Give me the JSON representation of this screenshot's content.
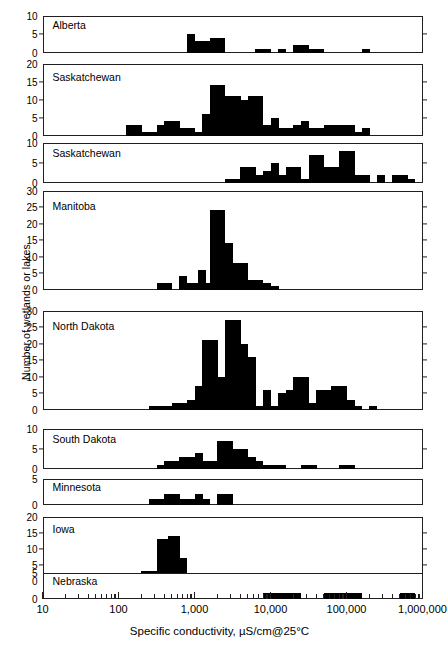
{
  "figure": {
    "ylabel": "Number of wetlands or lakes",
    "xlabel": "Specific conductivity, µS/cm@25°C",
    "x_axis": {
      "scale": "log",
      "min": 10,
      "max": 1000000,
      "tick_labels": [
        "10",
        "100",
        "1,000",
        "10,000",
        "100,000",
        "1,000,000"
      ],
      "tick_values": [
        10,
        100,
        1000,
        10000,
        100000,
        1000000
      ]
    },
    "bar_color": "#000000",
    "frame_color": "#231f20"
  },
  "chart_data": {
    "type": "bar",
    "title": "",
    "xlabel": "Specific conductivity, µS/cm@25°C",
    "ylabel": "Number of wetlands or lakes",
    "xscale": "log",
    "xlim": [
      10,
      1000000
    ],
    "grid": false,
    "legend": "none",
    "note": "Nine stacked histogram panels of specific conductivity; bin edges given as log10 lower/upper bounds, one bin per 1/10 decade.",
    "bin_width_decades": 0.1,
    "panels": [
      {
        "region": "Alberta",
        "ylim": [
          0,
          10
        ],
        "yticks": [
          0,
          5,
          10
        ],
        "bins": [
          {
            "log10_lo": 2.9,
            "count": 5
          },
          {
            "log10_lo": 3.0,
            "count": 3
          },
          {
            "log10_lo": 3.1,
            "count": 3
          },
          {
            "log10_lo": 3.2,
            "count": 4
          },
          {
            "log10_lo": 3.3,
            "count": 4
          },
          {
            "log10_lo": 3.8,
            "count": 1
          },
          {
            "log10_lo": 3.9,
            "count": 1
          },
          {
            "log10_lo": 4.1,
            "count": 1
          },
          {
            "log10_lo": 4.3,
            "count": 2
          },
          {
            "log10_lo": 4.4,
            "count": 2
          },
          {
            "log10_lo": 4.5,
            "count": 1
          },
          {
            "log10_lo": 4.6,
            "count": 1
          },
          {
            "log10_lo": 5.2,
            "count": 1
          }
        ]
      },
      {
        "region": "Saskatchewan",
        "ylim": [
          0,
          20
        ],
        "yticks": [
          0,
          5,
          10,
          15,
          20
        ],
        "bins": [
          {
            "log10_lo": 2.1,
            "count": 3
          },
          {
            "log10_lo": 2.2,
            "count": 3
          },
          {
            "log10_lo": 2.3,
            "count": 1
          },
          {
            "log10_lo": 2.4,
            "count": 1
          },
          {
            "log10_lo": 2.5,
            "count": 3
          },
          {
            "log10_lo": 2.6,
            "count": 4
          },
          {
            "log10_lo": 2.7,
            "count": 4
          },
          {
            "log10_lo": 2.8,
            "count": 2
          },
          {
            "log10_lo": 2.9,
            "count": 2
          },
          {
            "log10_lo": 3.0,
            "count": 1
          },
          {
            "log10_lo": 3.1,
            "count": 6
          },
          {
            "log10_lo": 3.2,
            "count": 14
          },
          {
            "log10_lo": 3.3,
            "count": 14
          },
          {
            "log10_lo": 3.4,
            "count": 11
          },
          {
            "log10_lo": 3.5,
            "count": 11
          },
          {
            "log10_lo": 3.6,
            "count": 10
          },
          {
            "log10_lo": 3.7,
            "count": 11
          },
          {
            "log10_lo": 3.8,
            "count": 11
          },
          {
            "log10_lo": 3.9,
            "count": 3
          },
          {
            "log10_lo": 4.0,
            "count": 5
          },
          {
            "log10_lo": 4.1,
            "count": 2
          },
          {
            "log10_lo": 4.2,
            "count": 2
          },
          {
            "log10_lo": 4.3,
            "count": 3
          },
          {
            "log10_lo": 4.4,
            "count": 4
          },
          {
            "log10_lo": 4.5,
            "count": 2
          },
          {
            "log10_lo": 4.6,
            "count": 2
          },
          {
            "log10_lo": 4.7,
            "count": 3
          },
          {
            "log10_lo": 4.8,
            "count": 3
          },
          {
            "log10_lo": 4.9,
            "count": 3
          },
          {
            "log10_lo": 5.0,
            "count": 3
          },
          {
            "log10_lo": 5.1,
            "count": 1
          },
          {
            "log10_lo": 5.2,
            "count": 2
          }
        ]
      },
      {
        "region": "Saskatchewan",
        "ylim": [
          0,
          10
        ],
        "yticks": [
          0,
          5,
          10
        ],
        "bins": [
          {
            "log10_lo": 3.4,
            "count": 1
          },
          {
            "log10_lo": 3.5,
            "count": 1
          },
          {
            "log10_lo": 3.6,
            "count": 4
          },
          {
            "log10_lo": 3.7,
            "count": 4
          },
          {
            "log10_lo": 3.8,
            "count": 2
          },
          {
            "log10_lo": 3.9,
            "count": 3
          },
          {
            "log10_lo": 4.0,
            "count": 5
          },
          {
            "log10_lo": 4.1,
            "count": 2
          },
          {
            "log10_lo": 4.2,
            "count": 4
          },
          {
            "log10_lo": 4.3,
            "count": 4
          },
          {
            "log10_lo": 4.4,
            "count": 1
          },
          {
            "log10_lo": 4.5,
            "count": 7
          },
          {
            "log10_lo": 4.6,
            "count": 7
          },
          {
            "log10_lo": 4.7,
            "count": 4
          },
          {
            "log10_lo": 4.8,
            "count": 4
          },
          {
            "log10_lo": 4.9,
            "count": 8
          },
          {
            "log10_lo": 5.0,
            "count": 8
          },
          {
            "log10_lo": 5.1,
            "count": 2
          },
          {
            "log10_lo": 5.2,
            "count": 2
          },
          {
            "log10_lo": 5.4,
            "count": 2
          },
          {
            "log10_lo": 5.6,
            "count": 2
          },
          {
            "log10_lo": 5.7,
            "count": 2
          },
          {
            "log10_lo": 5.8,
            "count": 1
          }
        ]
      },
      {
        "region": "Manitoba",
        "ylim": [
          0,
          30
        ],
        "yticks": [
          0,
          5,
          10,
          15,
          20,
          25,
          30
        ],
        "bins": [
          {
            "log10_lo": 2.5,
            "count": 2
          },
          {
            "log10_lo": 2.6,
            "count": 2
          },
          {
            "log10_lo": 2.8,
            "count": 4
          },
          {
            "log10_lo": 2.9,
            "count": 2
          },
          {
            "log10_lo": 3.0,
            "count": 2
          },
          {
            "log10_lo": 3.05,
            "count": 6
          },
          {
            "log10_lo": 3.1,
            "count": 2
          },
          {
            "log10_lo": 3.2,
            "count": 24
          },
          {
            "log10_lo": 3.3,
            "count": 24
          },
          {
            "log10_lo": 3.4,
            "count": 14
          },
          {
            "log10_lo": 3.5,
            "count": 8
          },
          {
            "log10_lo": 3.6,
            "count": 8
          },
          {
            "log10_lo": 3.7,
            "count": 3
          },
          {
            "log10_lo": 3.8,
            "count": 3
          },
          {
            "log10_lo": 3.9,
            "count": 2
          },
          {
            "log10_lo": 4.0,
            "count": 1
          }
        ]
      },
      {
        "region": "North Dakota",
        "ylim": [
          0,
          30
        ],
        "yticks": [
          0,
          5,
          10,
          15,
          20,
          25,
          30
        ],
        "bins": [
          {
            "log10_lo": 2.4,
            "count": 1
          },
          {
            "log10_lo": 2.5,
            "count": 1
          },
          {
            "log10_lo": 2.6,
            "count": 1
          },
          {
            "log10_lo": 2.7,
            "count": 2
          },
          {
            "log10_lo": 2.8,
            "count": 2
          },
          {
            "log10_lo": 2.9,
            "count": 3
          },
          {
            "log10_lo": 3.0,
            "count": 7
          },
          {
            "log10_lo": 3.1,
            "count": 21
          },
          {
            "log10_lo": 3.2,
            "count": 21
          },
          {
            "log10_lo": 3.3,
            "count": 10
          },
          {
            "log10_lo": 3.4,
            "count": 27
          },
          {
            "log10_lo": 3.5,
            "count": 27
          },
          {
            "log10_lo": 3.6,
            "count": 20
          },
          {
            "log10_lo": 3.7,
            "count": 16
          },
          {
            "log10_lo": 3.8,
            "count": 1
          },
          {
            "log10_lo": 3.9,
            "count": 6
          },
          {
            "log10_lo": 4.0,
            "count": 1
          },
          {
            "log10_lo": 4.1,
            "count": 5
          },
          {
            "log10_lo": 4.2,
            "count": 6
          },
          {
            "log10_lo": 4.3,
            "count": 10
          },
          {
            "log10_lo": 4.4,
            "count": 10
          },
          {
            "log10_lo": 4.5,
            "count": 2
          },
          {
            "log10_lo": 4.6,
            "count": 6
          },
          {
            "log10_lo": 4.7,
            "count": 6
          },
          {
            "log10_lo": 4.8,
            "count": 7
          },
          {
            "log10_lo": 4.9,
            "count": 7
          },
          {
            "log10_lo": 5.0,
            "count": 3
          },
          {
            "log10_lo": 5.1,
            "count": 1
          },
          {
            "log10_lo": 5.3,
            "count": 1
          }
        ]
      },
      {
        "region": "South Dakota",
        "ylim": [
          0,
          10
        ],
        "yticks": [
          0,
          5,
          10
        ],
        "bins": [
          {
            "log10_lo": 2.5,
            "count": 1
          },
          {
            "log10_lo": 2.6,
            "count": 2
          },
          {
            "log10_lo": 2.7,
            "count": 2
          },
          {
            "log10_lo": 2.8,
            "count": 3
          },
          {
            "log10_lo": 2.9,
            "count": 3
          },
          {
            "log10_lo": 3.0,
            "count": 4
          },
          {
            "log10_lo": 3.1,
            "count": 2
          },
          {
            "log10_lo": 3.2,
            "count": 2
          },
          {
            "log10_lo": 3.3,
            "count": 7
          },
          {
            "log10_lo": 3.4,
            "count": 7
          },
          {
            "log10_lo": 3.5,
            "count": 5
          },
          {
            "log10_lo": 3.6,
            "count": 5
          },
          {
            "log10_lo": 3.7,
            "count": 3
          },
          {
            "log10_lo": 3.8,
            "count": 2
          },
          {
            "log10_lo": 3.9,
            "count": 1
          },
          {
            "log10_lo": 4.0,
            "count": 1
          },
          {
            "log10_lo": 4.1,
            "count": 1
          },
          {
            "log10_lo": 4.4,
            "count": 1
          },
          {
            "log10_lo": 4.5,
            "count": 1
          },
          {
            "log10_lo": 4.9,
            "count": 1
          },
          {
            "log10_lo": 5.0,
            "count": 1
          }
        ]
      },
      {
        "region": "Minnesota",
        "ylim": [
          0,
          5
        ],
        "yticks": [
          0,
          5
        ],
        "bins": [
          {
            "log10_lo": 2.4,
            "count": 1
          },
          {
            "log10_lo": 2.5,
            "count": 1
          },
          {
            "log10_lo": 2.6,
            "count": 2
          },
          {
            "log10_lo": 2.7,
            "count": 2
          },
          {
            "log10_lo": 2.8,
            "count": 1
          },
          {
            "log10_lo": 2.9,
            "count": 1
          },
          {
            "log10_lo": 3.0,
            "count": 2
          },
          {
            "log10_lo": 3.1,
            "count": 1
          },
          {
            "log10_lo": 3.3,
            "count": 2
          },
          {
            "log10_lo": 3.4,
            "count": 2
          }
        ]
      },
      {
        "region": "Iowa",
        "ylim": [
          0,
          20
        ],
        "yticks": [
          0,
          5,
          10,
          15,
          20
        ],
        "bins": [
          {
            "log10_lo": 1.85,
            "count": 1
          },
          {
            "log10_lo": 2.2,
            "count": 2
          },
          {
            "log10_lo": 2.3,
            "count": 3
          },
          {
            "log10_lo": 2.4,
            "count": 3
          },
          {
            "log10_lo": 2.5,
            "count": 13
          },
          {
            "log10_lo": 2.6,
            "count": 13
          },
          {
            "log10_lo": 2.65,
            "count": 14
          },
          {
            "log10_lo": 2.7,
            "count": 14
          },
          {
            "log10_lo": 2.8,
            "count": 7
          },
          {
            "log10_lo": 2.9,
            "count": 2
          }
        ]
      },
      {
        "region": "Nebraska",
        "ylim": [
          0,
          5
        ],
        "yticks": [
          0,
          5
        ],
        "bins": [
          {
            "log10_lo": 3.9,
            "count": 1
          },
          {
            "log10_lo": 4.0,
            "count": 1
          },
          {
            "log10_lo": 4.1,
            "count": 1
          },
          {
            "log10_lo": 4.2,
            "count": 1
          },
          {
            "log10_lo": 4.3,
            "count": 1
          },
          {
            "log10_lo": 4.7,
            "count": 1
          },
          {
            "log10_lo": 4.8,
            "count": 1
          },
          {
            "log10_lo": 4.9,
            "count": 1
          },
          {
            "log10_lo": 5.0,
            "count": 1
          },
          {
            "log10_lo": 5.1,
            "count": 1
          },
          {
            "log10_lo": 5.7,
            "count": 1
          },
          {
            "log10_lo": 5.8,
            "count": 1
          }
        ]
      }
    ]
  }
}
